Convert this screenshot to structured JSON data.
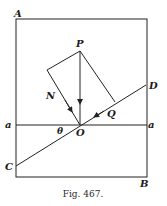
{
  "figure": {
    "caption": "Fig. 467.",
    "labels": {
      "A": "A",
      "B": "B",
      "C": "C",
      "D": "D",
      "P": "P",
      "N": "N",
      "Q": "Q",
      "O": "O",
      "theta": "θ",
      "a_left": "a",
      "a_right": "a"
    },
    "colors": {
      "stroke": "#222222",
      "background": "#ffffff"
    }
  }
}
